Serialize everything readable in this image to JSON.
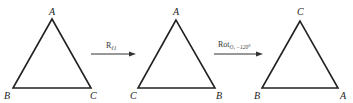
{
  "diagram": {
    "triangles": [
      {
        "id": "t1",
        "apex": "A",
        "bottom_left": "B",
        "bottom_right": "C"
      },
      {
        "id": "t2",
        "apex": "A",
        "bottom_left": "C",
        "bottom_right": "B"
      },
      {
        "id": "t3",
        "apex": "C",
        "bottom_left": "B",
        "bottom_right": "A"
      }
    ],
    "arrows": [
      {
        "id": "reflection",
        "label_main": "R",
        "label_sub": "ℓ1"
      },
      {
        "id": "rotation",
        "label_main": "Rot",
        "label_sub": "O, −120°"
      }
    ],
    "colors": {
      "stroke": "#222222",
      "text": "#222222"
    }
  }
}
